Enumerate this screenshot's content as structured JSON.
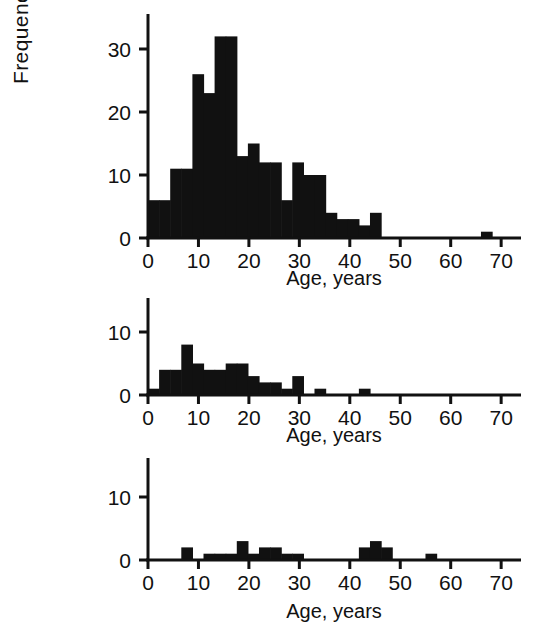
{
  "figure": {
    "ylabel": "Frequency",
    "background_color": "#ffffff",
    "bar_color": "#111111",
    "axis_color": "#111111"
  },
  "chart_data": [
    {
      "type": "bar",
      "panel": "top",
      "title": "",
      "xlabel": "Age, years",
      "ylabel": "Frequency",
      "xlim": [
        0,
        72
      ],
      "ylim": [
        0,
        34
      ],
      "xticks": [
        0,
        10,
        20,
        30,
        40,
        50,
        60,
        70
      ],
      "yticks": [
        0,
        10,
        20,
        30
      ],
      "xtick_labels": [
        "0",
        "10",
        "20",
        "30",
        "40",
        "50",
        "60",
        "70"
      ],
      "ytick_labels": [
        "0",
        "10",
        "20",
        "30"
      ],
      "grid": false,
      "legend": "none",
      "bin_width": 2.2,
      "bin_starts": [
        0.0,
        2.2,
        4.4,
        6.6,
        8.8,
        11.0,
        13.2,
        15.4,
        17.6,
        19.8,
        22.0,
        24.2,
        26.4,
        28.6,
        30.8,
        33.0,
        35.2,
        37.4,
        39.6,
        41.8,
        44.0,
        66.0
      ],
      "values": [
        6,
        6,
        11,
        11,
        26,
        23,
        32,
        32,
        13,
        15,
        12,
        12,
        6,
        12,
        10,
        10,
        4,
        3,
        3,
        2,
        4,
        1
      ]
    },
    {
      "type": "bar",
      "panel": "middle",
      "title": "",
      "xlabel": "Age, years",
      "ylabel": "Frequency",
      "xlim": [
        0,
        72
      ],
      "ylim": [
        0,
        15
      ],
      "xticks": [
        0,
        10,
        20,
        30,
        40,
        50,
        60,
        70
      ],
      "yticks": [
        0,
        10
      ],
      "xtick_labels": [
        "0",
        "10",
        "20",
        "30",
        "40",
        "50",
        "60",
        "70"
      ],
      "ytick_labels": [
        "0",
        "10"
      ],
      "grid": false,
      "legend": "none",
      "bin_width": 2.2,
      "bin_starts": [
        0.0,
        2.2,
        4.4,
        6.6,
        8.8,
        11.0,
        13.2,
        15.4,
        17.6,
        19.8,
        22.0,
        24.2,
        26.4,
        28.6,
        33.0,
        41.8
      ],
      "values": [
        1,
        4,
        4,
        8,
        5,
        4,
        4,
        5,
        5,
        3,
        2,
        2,
        1,
        3,
        1,
        1
      ]
    },
    {
      "type": "bar",
      "panel": "bottom",
      "title": "",
      "xlabel": "Age, years",
      "ylabel": "Frequency",
      "xlim": [
        0,
        72
      ],
      "ylim": [
        0,
        17
      ],
      "xticks": [
        0,
        10,
        20,
        30,
        40,
        50,
        60,
        70
      ],
      "yticks": [
        0,
        10
      ],
      "xtick_labels": [
        "0",
        "10",
        "20",
        "30",
        "40",
        "50",
        "60",
        "70"
      ],
      "ytick_labels": [
        "0",
        "10"
      ],
      "grid": false,
      "legend": "none",
      "bin_width": 2.2,
      "bin_starts": [
        6.6,
        11.0,
        13.2,
        15.4,
        17.6,
        19.8,
        22.0,
        24.2,
        26.4,
        28.6,
        41.8,
        44.0,
        46.2,
        55.0
      ],
      "values": [
        2,
        1,
        1,
        1,
        3,
        1,
        2,
        2,
        1,
        1,
        2,
        3,
        2,
        1
      ]
    }
  ]
}
